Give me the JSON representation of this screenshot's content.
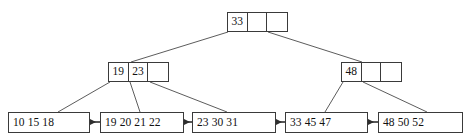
{
  "diagram": {
    "colors": {
      "stroke": "#3a3a3a",
      "text": "#111111",
      "background": "#ffffff",
      "edge": "#4a4a4a"
    },
    "root": {
      "id": "root-node",
      "cells": [
        "33",
        "",
        ""
      ],
      "x": 227,
      "y": 12,
      "width": 61,
      "height": 20
    },
    "internal_nodes": [
      {
        "id": "internal-node-left",
        "cells": [
          "19",
          "23",
          ""
        ],
        "x": 108,
        "y": 62,
        "width": 61,
        "height": 20
      },
      {
        "id": "internal-node-right",
        "cells": [
          "48",
          "",
          ""
        ],
        "x": 341,
        "y": 62,
        "width": 61,
        "height": 20
      }
    ],
    "leaf_nodes": [
      {
        "id": "leaf-node-1",
        "keys": "10 15 18",
        "x": 8,
        "y": 112,
        "width": 82,
        "height": 21
      },
      {
        "id": "leaf-node-2",
        "keys": "19 20 21 22",
        "x": 100,
        "y": 112,
        "width": 84,
        "height": 21
      },
      {
        "id": "leaf-node-3",
        "keys": "23 30 31",
        "x": 192,
        "y": 112,
        "width": 84,
        "height": 21
      },
      {
        "id": "leaf-node-4",
        "keys": "33 45 47",
        "x": 285,
        "y": 112,
        "width": 83,
        "height": 21
      },
      {
        "id": "leaf-node-5",
        "keys": "48 50 52",
        "x": 378,
        "y": 112,
        "width": 85,
        "height": 21
      }
    ],
    "pointer_edges": [
      {
        "name": "edge-root-to-left-internal",
        "x1": 228,
        "y1": 32,
        "x2": 131,
        "y2": 62
      },
      {
        "name": "edge-root-to-right-internal",
        "x1": 268,
        "y1": 32,
        "x2": 362,
        "y2": 62
      },
      {
        "name": "edge-left-internal-to-leaf1",
        "x1": 110,
        "y1": 82,
        "x2": 58,
        "y2": 112
      },
      {
        "name": "edge-left-internal-to-leaf2",
        "x1": 130,
        "y1": 82,
        "x2": 140,
        "y2": 112
      },
      {
        "name": "edge-left-internal-to-leaf3",
        "x1": 150,
        "y1": 82,
        "x2": 227,
        "y2": 112
      },
      {
        "name": "edge-right-internal-to-leaf4",
        "x1": 343,
        "y1": 82,
        "x2": 325,
        "y2": 112
      },
      {
        "name": "edge-right-internal-to-leaf5",
        "x1": 363,
        "y1": 82,
        "x2": 427,
        "y2": 112
      }
    ],
    "sibling_links": [
      {
        "name": "leaf-link-1-2",
        "x1": 100,
        "y1": 122,
        "x2": 90,
        "label": ""
      },
      {
        "name": "leaf-link-2-3",
        "x1": 192,
        "y1": 122,
        "x2": 184,
        "label": ""
      },
      {
        "name": "leaf-link-3-4",
        "x1": 285,
        "y1": 122,
        "x2": 276,
        "label": ""
      },
      {
        "name": "leaf-link-4-5",
        "x1": 378,
        "y1": 122,
        "x2": 368,
        "label": ""
      }
    ]
  }
}
